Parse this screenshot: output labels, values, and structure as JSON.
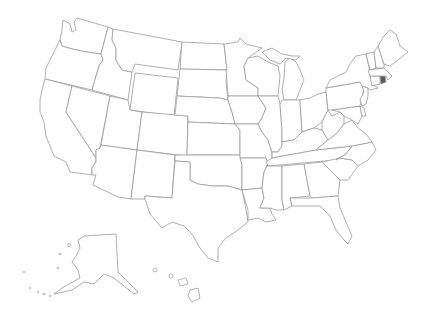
{
  "map": {
    "title": "United States",
    "type": "choropleth-outline",
    "colors": {
      "background": "#ffffff",
      "border": "#9a9a9a",
      "default_fill": "#ffffff",
      "highlight_fill": "#5a5a5a"
    },
    "highlighted_states": [
      "Rhode Island"
    ],
    "states": [
      {
        "id": "WA",
        "name": "Washington"
      },
      {
        "id": "OR",
        "name": "Oregon"
      },
      {
        "id": "CA",
        "name": "California"
      },
      {
        "id": "ID",
        "name": "Idaho"
      },
      {
        "id": "NV",
        "name": "Nevada"
      },
      {
        "id": "MT",
        "name": "Montana"
      },
      {
        "id": "WY",
        "name": "Wyoming"
      },
      {
        "id": "UT",
        "name": "Utah"
      },
      {
        "id": "AZ",
        "name": "Arizona"
      },
      {
        "id": "CO",
        "name": "Colorado"
      },
      {
        "id": "NM",
        "name": "New Mexico"
      },
      {
        "id": "ND",
        "name": "North Dakota"
      },
      {
        "id": "SD",
        "name": "South Dakota"
      },
      {
        "id": "NE",
        "name": "Nebraska"
      },
      {
        "id": "KS",
        "name": "Kansas"
      },
      {
        "id": "OK",
        "name": "Oklahoma"
      },
      {
        "id": "TX",
        "name": "Texas"
      },
      {
        "id": "MN",
        "name": "Minnesota"
      },
      {
        "id": "IA",
        "name": "Iowa"
      },
      {
        "id": "MO",
        "name": "Missouri"
      },
      {
        "id": "AR",
        "name": "Arkansas"
      },
      {
        "id": "LA",
        "name": "Louisiana"
      },
      {
        "id": "WI",
        "name": "Wisconsin"
      },
      {
        "id": "IL",
        "name": "Illinois"
      },
      {
        "id": "MI",
        "name": "Michigan"
      },
      {
        "id": "IN",
        "name": "Indiana"
      },
      {
        "id": "OH",
        "name": "Ohio"
      },
      {
        "id": "KY",
        "name": "Kentucky"
      },
      {
        "id": "TN",
        "name": "Tennessee"
      },
      {
        "id": "MS",
        "name": "Mississippi"
      },
      {
        "id": "AL",
        "name": "Alabama"
      },
      {
        "id": "GA",
        "name": "Georgia"
      },
      {
        "id": "FL",
        "name": "Florida"
      },
      {
        "id": "SC",
        "name": "South Carolina"
      },
      {
        "id": "NC",
        "name": "North Carolina"
      },
      {
        "id": "VA",
        "name": "Virginia"
      },
      {
        "id": "WV",
        "name": "West Virginia"
      },
      {
        "id": "MD",
        "name": "Maryland"
      },
      {
        "id": "DE",
        "name": "Delaware"
      },
      {
        "id": "PA",
        "name": "Pennsylvania"
      },
      {
        "id": "NJ",
        "name": "New Jersey"
      },
      {
        "id": "NY",
        "name": "New York"
      },
      {
        "id": "CT",
        "name": "Connecticut"
      },
      {
        "id": "RI",
        "name": "Rhode Island"
      },
      {
        "id": "MA",
        "name": "Massachusetts"
      },
      {
        "id": "VT",
        "name": "Vermont"
      },
      {
        "id": "NH",
        "name": "New Hampshire"
      },
      {
        "id": "ME",
        "name": "Maine"
      },
      {
        "id": "AK",
        "name": "Alaska"
      },
      {
        "id": "HI",
        "name": "Hawaii"
      }
    ]
  }
}
